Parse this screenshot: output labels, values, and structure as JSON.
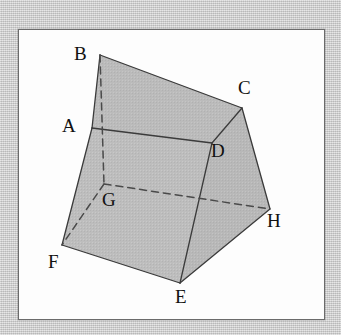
{
  "figure": {
    "background_color": "#c9c9c9",
    "panel_color": "#fdfdfd",
    "panel_border_color": "#6b6b6b",
    "face_fill_top": "#b8b8b8",
    "face_fill_front": "#bdbdbd",
    "face_fill_right": "#b5b5b5",
    "edge_color": "#3b3b3b",
    "hidden_edge_color": "#4a4a4a",
    "label_color": "#111111",
    "vertices": [
      {
        "name": "A",
        "label": "A",
        "x": 92,
        "y": 128,
        "hidden": false,
        "label_x": 62,
        "label_y": 116
      },
      {
        "name": "B",
        "label": "B",
        "x": 100,
        "y": 55,
        "hidden": false,
        "label_x": 74,
        "label_y": 44
      },
      {
        "name": "C",
        "label": "C",
        "x": 242,
        "y": 108,
        "hidden": false,
        "label_x": 238,
        "label_y": 78
      },
      {
        "name": "D",
        "label": "D",
        "x": 212,
        "y": 143,
        "hidden": false,
        "label_x": 211,
        "label_y": 141
      },
      {
        "name": "E",
        "label": "E",
        "x": 180,
        "y": 283,
        "hidden": false,
        "label_x": 175,
        "label_y": 287
      },
      {
        "name": "F",
        "label": "F",
        "x": 62,
        "y": 245,
        "hidden": false,
        "label_x": 48,
        "label_y": 252
      },
      {
        "name": "G",
        "label": "G",
        "x": 104,
        "y": 184,
        "hidden": true,
        "label_x": 102,
        "label_y": 190
      },
      {
        "name": "H",
        "label": "H",
        "x": 270,
        "y": 209,
        "hidden": false,
        "label_x": 267,
        "label_y": 211
      }
    ],
    "edges": [
      {
        "from": "A",
        "to": "B",
        "style": "solid"
      },
      {
        "from": "B",
        "to": "C",
        "style": "solid"
      },
      {
        "from": "C",
        "to": "D",
        "style": "solid"
      },
      {
        "from": "A",
        "to": "D",
        "style": "solid"
      },
      {
        "from": "A",
        "to": "F",
        "style": "solid"
      },
      {
        "from": "D",
        "to": "E",
        "style": "solid"
      },
      {
        "from": "F",
        "to": "E",
        "style": "solid"
      },
      {
        "from": "C",
        "to": "H",
        "style": "solid"
      },
      {
        "from": "E",
        "to": "H",
        "style": "solid"
      },
      {
        "from": "B",
        "to": "G",
        "style": "dashed"
      },
      {
        "from": "G",
        "to": "F",
        "style": "dashed"
      },
      {
        "from": "G",
        "to": "H",
        "style": "dashed"
      }
    ],
    "faces": [
      {
        "name": "top-face",
        "vertices": [
          "A",
          "B",
          "C",
          "D"
        ],
        "fill": "#b9b9b9"
      },
      {
        "name": "front-face",
        "vertices": [
          "A",
          "D",
          "E",
          "F"
        ],
        "fill": "#bfbfbf"
      },
      {
        "name": "right-face",
        "vertices": [
          "D",
          "C",
          "H",
          "E"
        ],
        "fill": "#b4b4b4"
      }
    ]
  }
}
